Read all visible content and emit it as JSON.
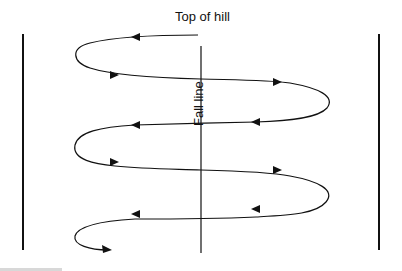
{
  "diagram": {
    "title": "Top of hill",
    "center_label": "Fall line",
    "colors": {
      "line": "#111111",
      "background": "#ffffff"
    },
    "elements": {
      "left_boundary": "vertical line left",
      "right_boundary": "vertical line right",
      "fall_line": "vertical center line",
      "path": "zig-zag traverse path with direction arrows descending from top of hill"
    }
  }
}
